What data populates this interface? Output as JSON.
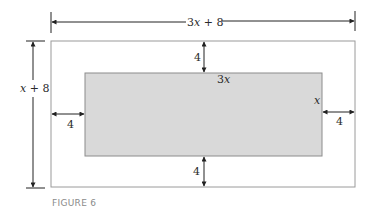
{
  "figure": {
    "caption": "FIGURE 6",
    "outer_width_label_coef": "3",
    "outer_width_label_var": "x",
    "outer_width_label_rest": " + 8",
    "outer_height_label_var": "x",
    "outer_height_label_rest": " + 8",
    "inner_width_label_coef": "3",
    "inner_width_label_var": "x",
    "inner_height_label": "x",
    "margin_top": "4",
    "margin_bottom": "4",
    "margin_left": "4",
    "margin_right": "4"
  },
  "colors": {
    "outer_border": "#9a9a9a",
    "inner_fill": "#d9d9d9",
    "inner_border": "#8c8c8c",
    "dimension_line": "#222222",
    "caption": "#8a8a8a"
  }
}
